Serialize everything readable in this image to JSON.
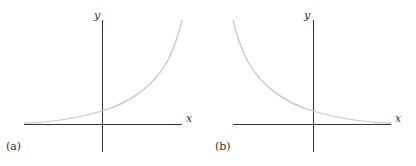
{
  "panels": [
    {
      "id": "a",
      "caption": "(a)",
      "x_label": "x",
      "y_label": "y",
      "description": "increasing exponential growth curve, y = b^x with b > 1",
      "curve_color": "#c8c8c8",
      "axis_color": "#333333"
    },
    {
      "id": "b",
      "caption": "(b)",
      "x_label": "x",
      "y_label": "y",
      "description": "decreasing exponential decay curve, y = b^x with 0 < b < 1",
      "curve_color": "#c8c8c8",
      "axis_color": "#333333"
    }
  ]
}
